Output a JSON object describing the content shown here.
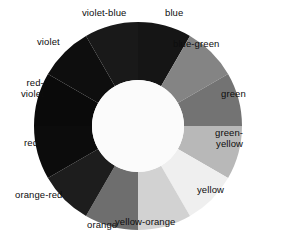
{
  "figure": {
    "name": "color-wheel",
    "background": "#ffffff"
  },
  "chart_data": {
    "type": "pie",
    "title": "",
    "subtitle": "",
    "xlabel": "",
    "ylabel": "",
    "legend_position": "around-slices",
    "grid": false,
    "donut": true,
    "inner_radius_ratio": 0.44,
    "outer_radius_px": 104,
    "inner_radius_px": 46,
    "center_px": [
      138,
      126
    ],
    "slice_angle_deg": 30,
    "start_angle_deg": -90,
    "categories": [
      "blue",
      "blue-green",
      "green",
      "green-yellow",
      "yellow",
      "yellow-orange",
      "orange",
      "orange-red",
      "red",
      "red-violet",
      "violet",
      "violet-blue"
    ],
    "values": [
      1,
      1,
      1,
      1,
      1,
      1,
      1,
      1,
      1,
      1,
      1,
      1
    ],
    "colors": [
      "#151515",
      "#848484",
      "#737373",
      "#b8b8b8",
      "#efefef",
      "#d2d2d2",
      "#6e6e6e",
      "#1d1d1d",
      "#0c0c0c",
      "#0a0a0a",
      "#0e0e0e",
      "#191919"
    ],
    "hole_color": "#fbfbfb",
    "annotations": [
      {
        "label": "violet-blue",
        "x": 104,
        "y": 13,
        "align": "ctr"
      },
      {
        "label": "blue",
        "x": 174,
        "y": 13,
        "align": "ctr"
      },
      {
        "label": "blue-green",
        "x": 219,
        "y": 44,
        "align": "right"
      },
      {
        "label": "green",
        "x": 246,
        "y": 94,
        "align": "right"
      },
      {
        "label": "green-\nyellow",
        "x": 243,
        "y": 138,
        "align": "right"
      },
      {
        "label": "yellow",
        "x": 224,
        "y": 190,
        "align": "right"
      },
      {
        "label": "yellow-orange",
        "x": 175,
        "y": 222,
        "align": "right"
      },
      {
        "label": "orange",
        "x": 102,
        "y": 225,
        "align": "ctr"
      },
      {
        "label": "orange-red",
        "x": 62,
        "y": 195,
        "align": "right"
      },
      {
        "label": "red",
        "x": 38,
        "y": 143,
        "align": "right"
      },
      {
        "label": "red-\nviolet",
        "x": 44,
        "y": 88,
        "align": "right"
      },
      {
        "label": "violet",
        "x": 60,
        "y": 42,
        "align": "right"
      }
    ]
  }
}
